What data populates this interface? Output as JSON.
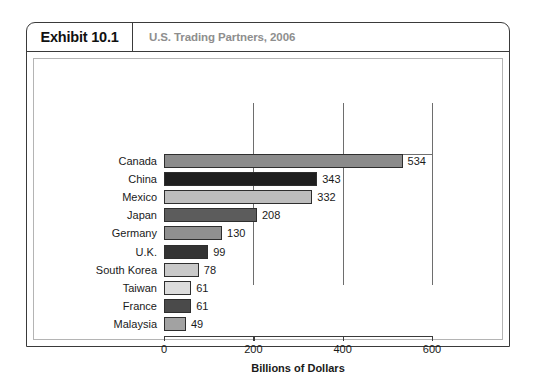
{
  "exhibit": {
    "number": "Exhibit 10.1",
    "title": "U.S. Trading Partners, 2006"
  },
  "chart_data": {
    "type": "bar",
    "orientation": "horizontal",
    "title": "U.S. Trading Partners, 2006",
    "xlabel": "Billions of Dollars",
    "ylabel": "",
    "xlim": [
      0,
      600
    ],
    "xticks": [
      0,
      200,
      400,
      600
    ],
    "xtick_labels": [
      "0",
      "200",
      "400",
      "600"
    ],
    "grid": true,
    "legend": "none",
    "categories": [
      "Canada",
      "China",
      "Mexico",
      "Japan",
      "Germany",
      "U.K.",
      "South Korea",
      "Taiwan",
      "France",
      "Malaysia"
    ],
    "values": [
      534,
      343,
      332,
      208,
      130,
      99,
      78,
      61,
      61,
      49
    ],
    "value_labels": [
      "534",
      "343",
      "332",
      "208",
      "130",
      "99",
      "78",
      "61",
      "61",
      "49"
    ],
    "bar_colors": [
      "#8b8b8b",
      "#1f1f1f",
      "#bdbdbd",
      "#5c5c5c",
      "#909090",
      "#333333",
      "#c9c9c9",
      "#dcdcdc",
      "#4a4a4a",
      "#a2a2a2"
    ],
    "bar_border_color": "#2e2e2e"
  },
  "colors": {
    "frame": "#3a3a3a",
    "inner_frame": "#b4b4b4",
    "subtitle": "#8e8e8e",
    "gridline": "#6e6e6e",
    "text": "#1a1a1a"
  }
}
